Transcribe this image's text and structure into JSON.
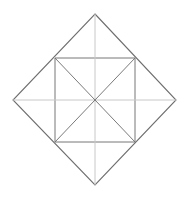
{
  "figure": {
    "title": "Diamond Pinwheel Geometric Figure",
    "background_color": "#ffffff",
    "canvas": {
      "width": 188,
      "height": 199
    },
    "colors": {
      "outer_edge": "#6e6e6e",
      "inner_edge": "#777777",
      "radial_diagonal": "#7a7a7a",
      "axis_line": "#c8c8c8"
    },
    "stroke_widths": {
      "outer_edge": 1.1,
      "inner_edge": 1.0,
      "radial_diagonal": 1.0,
      "axis_line": 1.0
    },
    "center_point": {
      "x": 95,
      "y": 100
    },
    "outer_diamond": {
      "name": "outer-diamond",
      "points": "95,14 176,100 95,185 13,100",
      "vertices": [
        {
          "label": "top",
          "x": 95,
          "y": 14
        },
        {
          "label": "right",
          "x": 176,
          "y": 100
        },
        {
          "label": "bottom",
          "x": 95,
          "y": 185
        },
        {
          "label": "left",
          "x": 13,
          "y": 100
        }
      ]
    },
    "inner_square": {
      "name": "inner-square",
      "points": "55,58 135,58 135,142 55,142",
      "vertices": [
        {
          "label": "top-left",
          "x": 55,
          "y": 58
        },
        {
          "label": "top-right",
          "x": 135,
          "y": 58
        },
        {
          "label": "bottom-right",
          "x": 135,
          "y": 142
        },
        {
          "label": "bottom-left",
          "x": 55,
          "y": 142
        }
      ]
    },
    "axis_lines": [
      {
        "name": "vertical-axis-line",
        "x1": 95,
        "y1": 14,
        "x2": 95,
        "y2": 185
      },
      {
        "name": "horizontal-axis-line",
        "x1": 13,
        "y1": 100,
        "x2": 176,
        "y2": 100
      }
    ],
    "radial_diagonals": [
      {
        "name": "radial-diagonal-top-left",
        "x1": 55,
        "y1": 58,
        "x2": 95,
        "y2": 100
      },
      {
        "name": "radial-diagonal-top-right",
        "x1": 135,
        "y1": 58,
        "x2": 95,
        "y2": 100
      },
      {
        "name": "radial-diagonal-bottom-right",
        "x1": 135,
        "y1": 142,
        "x2": 95,
        "y2": 100
      },
      {
        "name": "radial-diagonal-bottom-left",
        "x1": 55,
        "y1": 142,
        "x2": 95,
        "y2": 100
      }
    ]
  }
}
